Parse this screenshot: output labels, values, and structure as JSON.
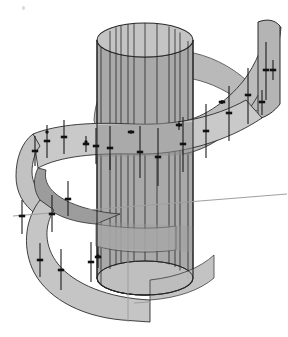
{
  "figure": {
    "title": "",
    "caption": "",
    "type": "3d-helicoid-surface-plot",
    "background_color": "#ffffff"
  },
  "colors": {
    "background": "#ffffff",
    "ribbon_top_light": "#c9c9c9",
    "ribbon_top_mid": "#bdbdbd",
    "ribbon_under_dark": "#9a9a9a",
    "cylinder_body": "#a9a9a9",
    "cylinder_overlap": "#8e8e8e",
    "cylinder_cap_top": "#c2c2c2",
    "cylinder_cap_bottom": "#bbbbbb",
    "end_panel": "#b2b2b2",
    "outline": "#2a2a2a",
    "ruling_line": "#1c1c1c",
    "tick_mark": "#111111",
    "axis_line": "#9f9f9f"
  },
  "geometry": {
    "canvas_width": 288,
    "canvas_height": 337,
    "cylinder": {
      "center_x": 145,
      "top_center_y": 40,
      "bottom_center_y": 278,
      "radius_x": 48,
      "radius_y": 17,
      "height": 238,
      "ruling_count": 12
    },
    "helicoid": {
      "turns": 1.25,
      "inner_radius": 48,
      "outer_radius": 120,
      "start_angle_deg": 200,
      "pitch_px": 175,
      "thickness_px": 2
    }
  },
  "chart_data": {
    "type": "scatter",
    "title": "",
    "xlabel": "",
    "ylabel": "",
    "grid": false,
    "legend": null,
    "surfaces": [
      {
        "name": "helicoid-ramp",
        "shade": "#c9c9c9"
      },
      {
        "name": "cylinder",
        "shade": "#a9a9a9"
      }
    ],
    "ruling_markers": [
      {
        "x": 22,
        "y_top": 200,
        "y_bot": 234,
        "tick_y": 216,
        "dot": null
      },
      {
        "x": 35,
        "y_top": 136,
        "y_bot": 166,
        "tick_y": 151,
        "dot": null
      },
      {
        "x": 40,
        "y_top": 243,
        "y_bot": 277,
        "tick_y": 260,
        "dot": null
      },
      {
        "x": 47,
        "y_top": 125,
        "y_bot": 158,
        "tick_y": 141,
        "dot": 132
      },
      {
        "x": 52,
        "y_top": 195,
        "y_bot": 232,
        "tick_y": 214,
        "dot": null
      },
      {
        "x": 61,
        "y_top": 249,
        "y_bot": 290,
        "tick_y": 270,
        "dot": null
      },
      {
        "x": 64,
        "y_top": 120,
        "y_bot": 154,
        "tick_y": 137,
        "dot": null
      },
      {
        "x": 68,
        "y_top": 181,
        "y_bot": 216,
        "tick_y": 199,
        "dot": null
      },
      {
        "x": 86,
        "y_top": 136,
        "y_bot": 152,
        "tick_y": 144,
        "dot": 142
      },
      {
        "x": 91,
        "y_top": 242,
        "y_bot": 282,
        "tick_y": 262,
        "dot": null
      },
      {
        "x": 96,
        "y_top": 128,
        "y_bot": 164,
        "tick_y": 146,
        "dot": null
      },
      {
        "x": 98,
        "y_top": 247,
        "y_bot": 268,
        "tick_y": 257,
        "dot": 256
      },
      {
        "x": 110,
        "y_top": 126,
        "y_bot": 170,
        "tick_y": 148,
        "dot": null
      },
      {
        "x": 131,
        "y_top": 131,
        "y_bot": 133,
        "tick_y": 132,
        "dot": 132
      },
      {
        "x": 140,
        "y_top": 126,
        "y_bot": 178,
        "tick_y": 152,
        "dot": null
      },
      {
        "x": 158,
        "y_top": 128,
        "y_bot": 186,
        "tick_y": 157,
        "dot": null
      },
      {
        "x": 179,
        "y_top": 121,
        "y_bot": 130,
        "tick_y": 125,
        "dot": 125
      },
      {
        "x": 183,
        "y_top": 117,
        "y_bot": 172,
        "tick_y": 144,
        "dot": null
      },
      {
        "x": 206,
        "y_top": 104,
        "y_bot": 158,
        "tick_y": 131,
        "dot": null
      },
      {
        "x": 222,
        "y_top": 100,
        "y_bot": 104,
        "tick_y": 102,
        "dot": 102
      },
      {
        "x": 229,
        "y_top": 86,
        "y_bot": 141,
        "tick_y": 113,
        "dot": null
      },
      {
        "x": 248,
        "y_top": 68,
        "y_bot": 124,
        "tick_y": 95,
        "dot": null
      },
      {
        "x": 262,
        "y_top": 90,
        "y_bot": 115,
        "tick_y": 102,
        "dot": null
      },
      {
        "x": 266,
        "y_top": 42,
        "y_bot": 100,
        "tick_y": 70,
        "dot": null
      },
      {
        "x": 273,
        "y_top": 60,
        "y_bot": 80,
        "tick_y": 70,
        "dot": null
      }
    ],
    "axes": [
      {
        "name": "horizontal-reference-axis",
        "x1": 13,
        "y1": 216,
        "x2": 287,
        "y2": 194
      },
      {
        "name": "vertical-reference-axis",
        "x1": 128,
        "y1": 255,
        "x2": 128,
        "y2": 322
      },
      {
        "name": "axis-tick-mark",
        "x1": 134,
        "y1": 303,
        "x2": 150,
        "y2": 302
      }
    ]
  }
}
